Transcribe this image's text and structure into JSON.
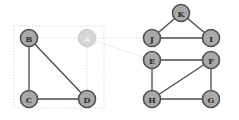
{
  "diagram": {
    "type": "undirected-graph",
    "colors": {
      "node_fill": "#a9a9a9",
      "node_stroke": "#505050",
      "edge": "#4a4a4a",
      "faded_node_fill": "#d6d6d6",
      "guide_line": "#d2d2d2"
    },
    "nodes": [
      {
        "id": "A",
        "label": "A",
        "x": 87,
        "y": 38,
        "faded": true
      },
      {
        "id": "B",
        "label": "B",
        "x": 29,
        "y": 38,
        "faded": false
      },
      {
        "id": "C",
        "label": "C",
        "x": 29,
        "y": 99,
        "faded": false
      },
      {
        "id": "D",
        "label": "D",
        "x": 87,
        "y": 99,
        "faded": false
      },
      {
        "id": "K",
        "label": "K",
        "x": 181,
        "y": 13,
        "faded": false
      },
      {
        "id": "J",
        "label": "J",
        "x": 152,
        "y": 38,
        "faded": false
      },
      {
        "id": "I",
        "label": "I",
        "x": 211,
        "y": 38,
        "faded": false
      },
      {
        "id": "E",
        "label": "E",
        "x": 152,
        "y": 60,
        "faded": false
      },
      {
        "id": "F",
        "label": "F",
        "x": 211,
        "y": 60,
        "faded": false
      },
      {
        "id": "H",
        "label": "H",
        "x": 152,
        "y": 99,
        "faded": false
      },
      {
        "id": "G",
        "label": "G",
        "x": 211,
        "y": 99,
        "faded": false
      }
    ],
    "edges": [
      {
        "from": "B",
        "to": "C"
      },
      {
        "from": "B",
        "to": "D"
      },
      {
        "from": "C",
        "to": "D"
      },
      {
        "from": "K",
        "to": "J"
      },
      {
        "from": "K",
        "to": "I"
      },
      {
        "from": "J",
        "to": "I"
      },
      {
        "from": "E",
        "to": "F"
      },
      {
        "from": "E",
        "to": "H"
      },
      {
        "from": "F",
        "to": "H"
      },
      {
        "from": "F",
        "to": "G"
      },
      {
        "from": "H",
        "to": "G"
      }
    ],
    "faded_edges": [
      {
        "from": "B",
        "to": "A"
      },
      {
        "from": "A",
        "to": "D"
      },
      {
        "from": "A",
        "to": "J"
      },
      {
        "from": "A",
        "to": "E"
      }
    ]
  }
}
